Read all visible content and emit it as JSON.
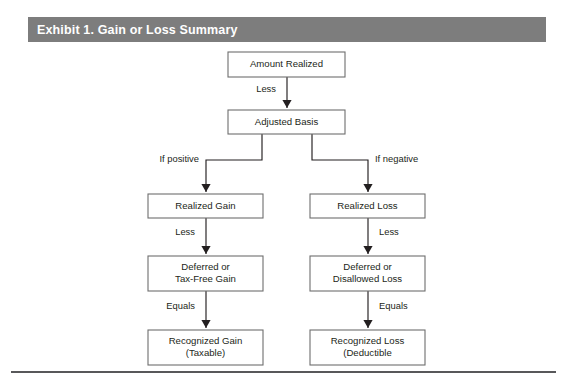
{
  "header": {
    "title": "Exhibit 1. Gain or Loss Summary",
    "bar_color": "#7d7d7d",
    "text_color": "#ffffff"
  },
  "diagram": {
    "type": "flowchart",
    "orientation": "top-down",
    "box_stroke_color": "#6e6e6e",
    "line_color": "#231f20",
    "nodes": [
      {
        "id": "amount_realized",
        "lines": [
          "Amount Realized"
        ],
        "x": 228,
        "y": 52,
        "w": 117,
        "h": 25
      },
      {
        "id": "adjusted_basis",
        "lines": [
          "Adjusted Basis"
        ],
        "x": 228,
        "y": 110,
        "w": 117,
        "h": 24
      },
      {
        "id": "realized_gain",
        "lines": [
          "Realized Gain"
        ],
        "x": 148,
        "y": 194,
        "w": 115,
        "h": 24
      },
      {
        "id": "realized_loss",
        "lines": [
          "Realized Loss"
        ],
        "x": 310,
        "y": 194,
        "w": 115,
        "h": 24
      },
      {
        "id": "deferred_gain",
        "lines": [
          "Deferred or",
          "Tax-Free Gain"
        ],
        "x": 148,
        "y": 256,
        "w": 115,
        "h": 35
      },
      {
        "id": "deferred_loss",
        "lines": [
          "Deferred or",
          "Disallowed Loss"
        ],
        "x": 310,
        "y": 256,
        "w": 115,
        "h": 35
      },
      {
        "id": "recognized_gain",
        "lines": [
          "Recognized Gain",
          "(Taxable)"
        ],
        "x": 148,
        "y": 330,
        "w": 115,
        "h": 35
      },
      {
        "id": "recognized_loss",
        "lines": [
          "Recognized Loss",
          "(Deductible"
        ],
        "x": 310,
        "y": 330,
        "w": 115,
        "h": 35
      }
    ],
    "edges": [
      {
        "id": "e_amount_to_basis",
        "from": "amount_realized",
        "to": "adjusted_basis",
        "kind": "straight",
        "x": 287,
        "y1": 77,
        "y2": 108,
        "label": "Less",
        "label_side": "left",
        "label_x": 276,
        "label_y": 90
      },
      {
        "id": "e_basis_to_gain",
        "from": "adjusted_basis",
        "to": "realized_gain",
        "kind": "elbow",
        "x_start": 262,
        "y_start": 134,
        "y_mid": 160,
        "x_end": 206,
        "y_end": 192,
        "label": "If positive",
        "label_side": "left",
        "label_x": 199,
        "label_y": 160
      },
      {
        "id": "e_basis_to_loss",
        "from": "adjusted_basis",
        "to": "realized_loss",
        "kind": "elbow",
        "x_start": 312,
        "y_start": 134,
        "y_mid": 160,
        "x_end": 368,
        "y_end": 192,
        "label": "If negative",
        "label_side": "right",
        "label_x": 375,
        "label_y": 160
      },
      {
        "id": "e_gain_to_deferred",
        "from": "realized_gain",
        "to": "deferred_gain",
        "kind": "straight",
        "x": 206,
        "y1": 218,
        "y2": 254,
        "label": "Less",
        "label_side": "left",
        "label_x": 195,
        "label_y": 233
      },
      {
        "id": "e_loss_to_deferred",
        "from": "realized_loss",
        "to": "deferred_loss",
        "kind": "straight",
        "x": 368,
        "y1": 218,
        "y2": 254,
        "label": "Less",
        "label_side": "right",
        "label_x": 379,
        "label_y": 233
      },
      {
        "id": "e_deferred_to_recog_g",
        "from": "deferred_gain",
        "to": "recognized_gain",
        "kind": "straight",
        "x": 206,
        "y1": 291,
        "y2": 328,
        "label": "Equals",
        "label_side": "left",
        "label_x": 195,
        "label_y": 307
      },
      {
        "id": "e_deferred_to_recog_l",
        "from": "deferred_loss",
        "to": "recognized_loss",
        "kind": "straight",
        "x": 368,
        "y1": 291,
        "y2": 328,
        "label": "Equals",
        "label_side": "right",
        "label_x": 379,
        "label_y": 307
      }
    ]
  }
}
